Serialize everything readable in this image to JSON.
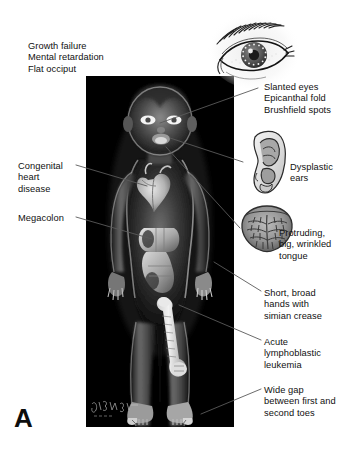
{
  "figure": {
    "panel_letter": "A",
    "background_color": "#ffffff",
    "photo_background_color": "#000000",
    "text_color": "#111111",
    "leader_line_color": "#5a5a5a",
    "artist_signature": "Feldman 2004"
  },
  "callouts": [
    {
      "id": "growth-failure",
      "side": "left",
      "lines": [
        "Growth failure",
        "Mental retardation",
        "Flat occiput"
      ],
      "text": "Growth failure\nMental retardation\nFlat occiput",
      "x": 28,
      "y": 41
    },
    {
      "id": "slanted-eyes",
      "side": "right",
      "lines": [
        "Slanted eyes",
        "Epicanthal fold",
        "Brushfield spots"
      ],
      "text": "Slanted eyes\nEpicanthal fold\nBrushfield spots",
      "x": 264,
      "y": 82
    },
    {
      "id": "congenital-heart-disease",
      "side": "left",
      "lines": [
        "Congenital",
        "heart",
        "disease"
      ],
      "text": "Congenital\nheart\ndisease",
      "x": 18,
      "y": 161
    },
    {
      "id": "dysplastic-ears",
      "side": "right",
      "lines": [
        "Dysplastic",
        "ears"
      ],
      "text": "Dysplastic\nears",
      "x": 290,
      "y": 162
    },
    {
      "id": "megacolon",
      "side": "left",
      "lines": [
        "Megacolon"
      ],
      "text": "Megacolon",
      "x": 18,
      "y": 213
    },
    {
      "id": "protruding-tongue",
      "side": "right",
      "lines": [
        "Protruding,",
        "big, wrinkled",
        "tongue"
      ],
      "text": "Protruding,\nbig, wrinkled\ntongue",
      "x": 279,
      "y": 228
    },
    {
      "id": "short-broad-hands",
      "side": "right",
      "lines": [
        "Short, broad",
        "hands with",
        "simian crease"
      ],
      "text": "Short, broad\nhands with\nsimian crease",
      "x": 264,
      "y": 288
    },
    {
      "id": "acute-lymphoblastic-leukemia",
      "side": "right",
      "lines": [
        "Acute",
        "lymphoblastic",
        "leukemia"
      ],
      "text": "Acute\nlymphoblastic\nleukemia",
      "x": 264,
      "y": 337
    },
    {
      "id": "wide-gap-toes",
      "side": "right",
      "lines": [
        "Wide gap",
        "between first and",
        "second toes"
      ],
      "text": "Wide gap\nbetween first and\nsecond toes",
      "x": 264,
      "y": 385
    }
  ],
  "insets": [
    {
      "id": "eye-inset",
      "name": "slanted-eye-drawing",
      "x": 206,
      "y": 8,
      "w": 96,
      "h": 82
    },
    {
      "id": "ear-inset",
      "name": "dysplastic-ear-drawing",
      "x": 243,
      "y": 127,
      "w": 46,
      "h": 70
    },
    {
      "id": "tongue-inset",
      "name": "wrinkled-tongue-drawing",
      "x": 238,
      "y": 202,
      "w": 58,
      "h": 52
    }
  ],
  "leader_lines": [
    {
      "id": "line-eyes",
      "from": [
        258,
        88
      ],
      "to": [
        160,
        123
      ]
    },
    {
      "id": "line-ears",
      "from": [
        243,
        162
      ],
      "to": [
        170,
        138
      ]
    },
    {
      "id": "line-tongue",
      "from": [
        240,
        228
      ],
      "to": [
        166,
        147
      ]
    },
    {
      "id": "line-heart",
      "from": [
        76,
        165
      ],
      "to": [
        147,
        186
      ]
    },
    {
      "id": "line-colon",
      "from": [
        76,
        217
      ],
      "to": [
        152,
        239
      ]
    },
    {
      "id": "line-hands",
      "from": [
        261,
        291
      ],
      "to": [
        214,
        262
      ]
    },
    {
      "id": "line-leukemia",
      "from": [
        261,
        340
      ],
      "to": [
        179,
        305
      ]
    },
    {
      "id": "line-toes",
      "from": [
        261,
        389
      ],
      "to": [
        201,
        414
      ]
    }
  ],
  "photo_panel": {
    "name": "pediatric-radiograph-illustration",
    "description_visible": "dark radiographic-style illustration of a standing child with visible heart, colon and femur",
    "x": 86,
    "y": 76,
    "w": 148,
    "h": 351
  }
}
